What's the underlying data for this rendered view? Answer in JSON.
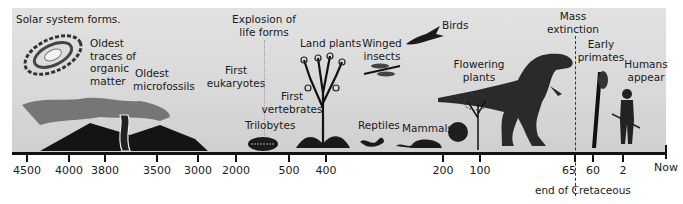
{
  "diagram": {
    "type": "geologic-timeline",
    "axis": {
      "unit_note": "millions of years ago",
      "ticks": [
        {
          "label": "4500",
          "x": 27
        },
        {
          "label": "4000",
          "x": 69
        },
        {
          "label": "3800",
          "x": 105
        },
        {
          "label": "3500",
          "x": 157
        },
        {
          "label": "3000",
          "x": 198
        },
        {
          "label": "2000",
          "x": 236
        },
        {
          "label": "500",
          "x": 289
        },
        {
          "label": "400",
          "x": 326
        },
        {
          "label": "200",
          "x": 443
        },
        {
          "label": "100",
          "x": 480
        },
        {
          "label": "65",
          "x": 575
        },
        {
          "label": "60",
          "x": 593
        },
        {
          "label": "2",
          "x": 623
        },
        {
          "label": "Now",
          "x": 666
        }
      ],
      "cretaceous_note": "end of Cretaceous"
    },
    "events": {
      "solar_system": "Solar system forms.",
      "organic_matter": [
        "Oldest",
        "traces of",
        "organic",
        "matter"
      ],
      "microfossils": [
        "Oldest",
        "microfossils"
      ],
      "eukaryotes": [
        "First",
        "eukaryotes"
      ],
      "explosion": [
        "Explosion of",
        "life forms"
      ],
      "trilobytes": "Trilobytes",
      "vertebrates": [
        "First",
        "vertebrates"
      ],
      "land_plants": "Land plants",
      "winged_insects": [
        "Winged",
        "insects"
      ],
      "reptiles": "Reptiles",
      "mammals": "Mammals",
      "birds": "Birds",
      "flowering_plants": [
        "Flowering",
        "plants"
      ],
      "mass_extinction": [
        "Mass",
        "extinction"
      ],
      "early_primates": [
        "Early",
        "primates"
      ],
      "humans": [
        "Humans",
        "appear"
      ]
    },
    "illustrations": [
      "galaxy-spiral",
      "volcano-eruption",
      "stromatolite-column",
      "trilobite",
      "land-plant-tree",
      "dragonfly",
      "lizard",
      "rodent",
      "bird-archaeopteryx",
      "tyrannosaurus",
      "flowering-shrub",
      "primate-on-branch",
      "early-human"
    ],
    "colors": {
      "panel": "#d9d9d9",
      "ink": "#111111",
      "background": "#ffffff"
    }
  }
}
